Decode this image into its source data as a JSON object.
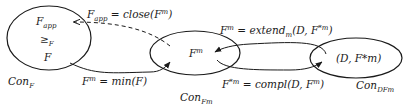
{
  "diagram": {
    "nodes": [
      {
        "id": "con_f",
        "region_label": {
          "base": "Con",
          "sub": "F"
        },
        "contents": [
          {
            "base": "F",
            "sub": "app"
          },
          {
            "base": "≥",
            "sub": "F"
          },
          {
            "base": "F",
            "sub": ""
          }
        ]
      },
      {
        "id": "con_fm",
        "region_label": {
          "base": "Con",
          "sub": "Fm"
        },
        "contents": [
          {
            "base": "F",
            "sup": "m"
          }
        ]
      },
      {
        "id": "con_dfm",
        "region_label": {
          "base": "Con",
          "sub": "DFm"
        },
        "contents": [
          {
            "text": "(D, F*m)"
          }
        ]
      }
    ],
    "edges": [
      {
        "id": "close",
        "from": "con_fm",
        "to": "con_f",
        "style": "dashed",
        "label": {
          "lhs": "F",
          "lhs_sub": "app",
          "eq": " = ",
          "fn": "close",
          "args": "(F",
          "args_sup": "m",
          "close": ")"
        }
      },
      {
        "id": "min",
        "from": "con_f",
        "to": "con_fm",
        "style": "solid",
        "label": {
          "lhs": "F",
          "lhs_sup": "m",
          "eq": " = ",
          "fn": "min",
          "args": "(F)"
        }
      },
      {
        "id": "extend",
        "from": "con_dfm",
        "to": "con_fm",
        "style": "solid",
        "label": {
          "lhs": "F",
          "lhs_sup": "m",
          "eq": " = ",
          "fn": "extend",
          "fn_sub": "m",
          "args": "(D, F",
          "args_sup": "*m",
          "close": ")"
        }
      },
      {
        "id": "compl",
        "from": "con_fm",
        "to": "con_dfm",
        "style": "solid",
        "label": {
          "lhs": "F",
          "lhs_sup": "*m",
          "eq": " = ",
          "fn": "compl",
          "args": "(D, F",
          "args_sup": "m",
          "close": ")"
        }
      }
    ],
    "colors": {
      "stroke": "#1a1a1a",
      "background": "#ffffff"
    }
  }
}
